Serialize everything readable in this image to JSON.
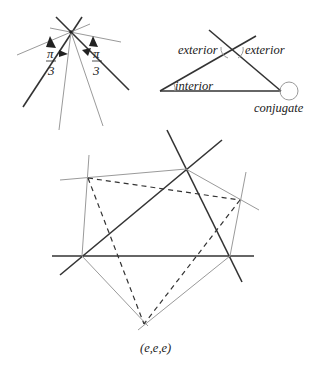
{
  "figure_a": {
    "labels": {
      "left_num": "π",
      "left_den": "3",
      "right_num": "π",
      "right_den": "3"
    }
  },
  "figure_b": {
    "labels": {
      "exterior_left": "exterior",
      "exterior_right": "exterior",
      "interior": "interior",
      "conjugate": "conjugate"
    }
  },
  "figure_c": {
    "caption": "(e,e,e)"
  }
}
